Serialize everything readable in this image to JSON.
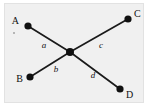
{
  "figure": {
    "type": "graph-diagram",
    "background_color": "#ffffff",
    "panel_color": "#f0f0f0",
    "panel_border_color": "#e2e2e2",
    "stroke_color": "#1a1a1a",
    "node_color": "#101010",
    "text_color": "#111111"
  },
  "nodes": [
    {
      "id": "A",
      "label": "A",
      "x": 28,
      "y": 26,
      "r": 3.6,
      "label_x": 19,
      "label_y": 24,
      "anchor": "end"
    },
    {
      "id": "C",
      "label": "C",
      "x": 128,
      "y": 19,
      "r": 3.6,
      "label_x": 134,
      "label_y": 17,
      "anchor": "start"
    },
    {
      "id": "B",
      "label": "B",
      "x": 30,
      "y": 77,
      "r": 3.6,
      "label_x": 23,
      "label_y": 82,
      "anchor": "end"
    },
    {
      "id": "D",
      "label": "D",
      "x": 120,
      "y": 89,
      "r": 3.6,
      "label_x": 126,
      "label_y": 98,
      "anchor": "start"
    },
    {
      "id": "center",
      "label": "",
      "x": 70,
      "y": 52,
      "r": 4.0,
      "label_x": 0,
      "label_y": 0,
      "anchor": "middle"
    }
  ],
  "edges": [
    {
      "id": "a",
      "label": "a",
      "from": "A",
      "to": "center",
      "x1": 28,
      "y1": 26,
      "x2": 70,
      "y2": 52,
      "label_x": 44,
      "label_y": 48
    },
    {
      "id": "b",
      "label": "b",
      "from": "B",
      "to": "center",
      "x1": 30,
      "y1": 77,
      "x2": 70,
      "y2": 52,
      "label_x": 56,
      "label_y": 72
    },
    {
      "id": "c",
      "label": "c",
      "from": "center",
      "to": "C",
      "x1": 70,
      "y1": 52,
      "x2": 128,
      "y2": 19,
      "label_x": 101,
      "label_y": 48
    },
    {
      "id": "d",
      "label": "d",
      "from": "center",
      "to": "D",
      "x1": 70,
      "y1": 52,
      "x2": 120,
      "y2": 89,
      "label_x": 93,
      "label_y": 78
    }
  ],
  "marks": [
    {
      "id": "speck",
      "x": 14,
      "y": 33,
      "r": 0.9
    }
  ]
}
